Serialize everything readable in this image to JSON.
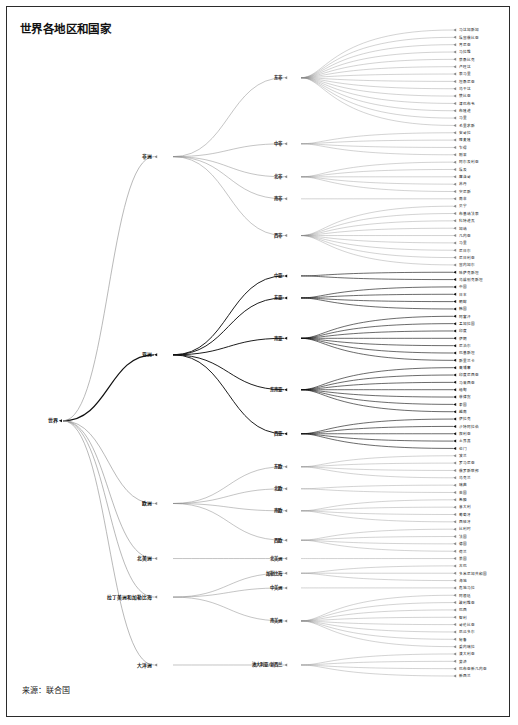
{
  "title": "世界各地区和国家",
  "source": "来源：联合国",
  "root": {
    "label": "世界"
  },
  "colors": {
    "dark": "#111111",
    "light": "#8a8a8a",
    "frame": "#2b2b2b",
    "background": "#ffffff"
  },
  "chart_data": {
    "type": "diagram",
    "title": "世界各地区和国家",
    "layout": "horizontal dendrogram / hierarchical edge-bundled tree, root at left",
    "root": "世界",
    "legend": "",
    "regions": [
      {
        "label": "非洲",
        "emphasis": "light",
        "subregions": [
          {
            "label": "东非",
            "countries": [
              "马达加斯加",
              "埃塞俄比亚",
              "肯尼亚",
              "马拉维",
              "莫桑比克",
              "卢旺达",
              "索马里",
              "坦桑尼亚",
              "乌干达",
              "赞比亚",
              "津巴布韦",
              "布隆迪",
              "马里",
              "毛里求斯"
            ]
          },
          {
            "label": "中非",
            "countries": [
              "安哥拉",
              "喀麦隆",
              "乍得",
              "刚果"
            ]
          },
          {
            "label": "北非",
            "countries": [
              "阿尔及利亚",
              "埃及",
              "摩洛哥",
              "苏丹",
              "突尼斯"
            ]
          },
          {
            "label": "南非",
            "countries": [
              "南非"
            ]
          },
          {
            "label": "西非",
            "countries": [
              "贝宁",
              "布基纳法索",
              "科特迪瓦",
              "加纳",
              "几内亚",
              "马里",
              "尼日尔",
              "尼日利亚",
              "塞内加尔"
            ]
          }
        ]
      },
      {
        "label": "亚洲",
        "emphasis": "dark",
        "subregions": [
          {
            "label": "中亚",
            "countries": [
              "哈萨克斯坦",
              "乌兹别克斯坦"
            ]
          },
          {
            "label": "东亚",
            "countries": [
              "中国",
              "日本",
              "朝鲜",
              "韩国"
            ]
          },
          {
            "label": "南亚",
            "countries": [
              "阿富汗",
              "孟加拉国",
              "印度",
              "伊朗",
              "尼泊尔",
              "巴基斯坦",
              "斯里兰卡"
            ]
          },
          {
            "label": "东南亚",
            "countries": [
              "柬埔寨",
              "印度尼西亚",
              "马来西亚",
              "缅甸",
              "菲律宾",
              "泰国",
              "越南"
            ]
          },
          {
            "label": "西亚",
            "countries": [
              "伊拉克",
              "沙特阿拉伯",
              "叙利亚",
              "土耳其",
              "也门"
            ]
          }
        ]
      },
      {
        "label": "欧洲",
        "emphasis": "light",
        "subregions": [
          {
            "label": "东欧",
            "countries": [
              "波兰",
              "罗马尼亚",
              "俄罗斯联邦",
              "乌克兰"
            ]
          },
          {
            "label": "北欧",
            "countries": [
              "瑞典",
              "英国"
            ]
          },
          {
            "label": "南欧",
            "countries": [
              "希腊",
              "意大利",
              "葡萄牙",
              "西班牙"
            ]
          },
          {
            "label": "西欧",
            "countries": [
              "比利时",
              "法国",
              "德国",
              "荷兰"
            ]
          }
        ]
      },
      {
        "label": "北美洲",
        "emphasis": "light",
        "subregions": [
          {
            "label": "北美洲",
            "countries": [
              "美国"
            ]
          }
        ]
      },
      {
        "label": "拉丁美洲和加勒比海",
        "emphasis": "light",
        "subregions": [
          {
            "label": "加勒比海",
            "countries": [
              "古巴",
              "多米尼加共和国",
              "海地"
            ]
          },
          {
            "label": "中美洲",
            "countries": [
              "危地马拉"
            ]
          },
          {
            "label": "南美洲",
            "countries": [
              "阿根廷",
              "玻利维亚",
              "巴西",
              "智利",
              "哥伦比亚",
              "厄瓜多尔",
              "秘鲁",
              "委内瑞拉"
            ]
          }
        ]
      },
      {
        "label": "大洋洲",
        "emphasis": "light",
        "subregions": [
          {
            "label": "澳大利亚/新西兰",
            "countries": [
              "澳大利亚",
              "斐济",
              "巴布亚新几内亚",
              "新西兰"
            ]
          }
        ]
      }
    ]
  }
}
